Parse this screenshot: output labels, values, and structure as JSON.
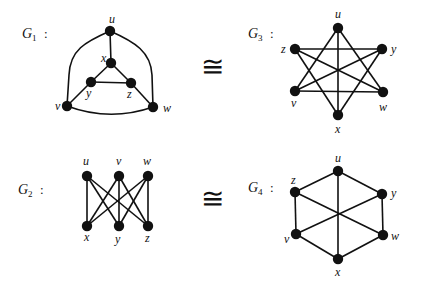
{
  "figure": {
    "isomorphism_symbol": "≅",
    "graphs": [
      {
        "id": "G1",
        "name": "G",
        "sub": "1",
        "colon": ":",
        "label_pos": [
          22,
          38
        ],
        "nodes": {
          "u": {
            "x": 110,
            "y": 31,
            "lx": 109,
            "ly": 23
          },
          "x": {
            "x": 111,
            "y": 63,
            "lx": 101,
            "ly": 62
          },
          "y": {
            "x": 91,
            "y": 82,
            "lx": 86,
            "ly": 97
          },
          "z": {
            "x": 131,
            "y": 83,
            "lx": 127,
            "ly": 98
          },
          "v": {
            "x": 67,
            "y": 106,
            "lx": 55,
            "ly": 110
          },
          "w": {
            "x": 153,
            "y": 107,
            "lx": 163,
            "ly": 112
          }
        },
        "edges": [
          [
            "u",
            "x"
          ],
          [
            "x",
            "y"
          ],
          [
            "x",
            "z"
          ],
          [
            "y",
            "z"
          ],
          [
            "y",
            "v"
          ],
          [
            "z",
            "w"
          ]
        ],
        "curved_edges": [
          {
            "from": "u",
            "to": "v",
            "path": "M110,31 C85,42 70,50 69,75 L67,106"
          },
          {
            "from": "u",
            "to": "w",
            "path": "M110,31 C135,42 151,52 152,75 L153,107"
          },
          {
            "from": "v",
            "to": "w",
            "path": "M67,106 Q110,122 153,107"
          }
        ]
      },
      {
        "id": "G3",
        "name": "G",
        "sub": "3",
        "colon": ":",
        "label_pos": [
          248,
          38
        ],
        "nodes": {
          "u": {
            "x": 338,
            "y": 28,
            "lx": 335,
            "ly": 18
          },
          "z": {
            "x": 295,
            "y": 49,
            "lx": 281,
            "ly": 53
          },
          "y": {
            "x": 382,
            "y": 49,
            "lx": 391,
            "ly": 53
          },
          "v": {
            "x": 295,
            "y": 91,
            "lx": 291,
            "ly": 107
          },
          "w": {
            "x": 383,
            "y": 92,
            "lx": 379,
            "ly": 111
          },
          "x": {
            "x": 338,
            "y": 115,
            "lx": 335,
            "ly": 133
          }
        },
        "edges": [
          [
            "u",
            "v"
          ],
          [
            "u",
            "w"
          ],
          [
            "v",
            "w"
          ],
          [
            "z",
            "y"
          ],
          [
            "y",
            "x"
          ],
          [
            "x",
            "z"
          ],
          [
            "u",
            "x"
          ],
          [
            "z",
            "w"
          ],
          [
            "y",
            "v"
          ]
        ],
        "curved_edges": []
      },
      {
        "id": "G2",
        "name": "G",
        "sub": "2",
        "colon": ":",
        "label_pos": [
          18,
          194
        ],
        "nodes": {
          "u": {
            "x": 87,
            "y": 176,
            "lx": 83,
            "ly": 165
          },
          "v": {
            "x": 119,
            "y": 176,
            "lx": 116,
            "ly": 165
          },
          "w": {
            "x": 148,
            "y": 176,
            "lx": 143,
            "ly": 165
          },
          "x": {
            "x": 87,
            "y": 226,
            "lx": 84,
            "ly": 241
          },
          "y": {
            "x": 119,
            "y": 226,
            "lx": 115,
            "ly": 243
          },
          "z": {
            "x": 148,
            "y": 226,
            "lx": 145,
            "ly": 242
          }
        },
        "edges": [
          [
            "u",
            "x"
          ],
          [
            "u",
            "y"
          ],
          [
            "u",
            "z"
          ],
          [
            "v",
            "x"
          ],
          [
            "v",
            "y"
          ],
          [
            "v",
            "z"
          ],
          [
            "w",
            "x"
          ],
          [
            "w",
            "y"
          ],
          [
            "w",
            "z"
          ]
        ],
        "curved_edges": []
      },
      {
        "id": "G4",
        "name": "G",
        "sub": "4",
        "colon": ":",
        "label_pos": [
          248,
          192
        ],
        "nodes": {
          "u": {
            "x": 338,
            "y": 171,
            "lx": 335,
            "ly": 162
          },
          "z": {
            "x": 295,
            "y": 192,
            "lx": 291,
            "ly": 184
          },
          "y": {
            "x": 382,
            "y": 194,
            "lx": 391,
            "ly": 197
          },
          "v": {
            "x": 296,
            "y": 234,
            "lx": 284,
            "ly": 243
          },
          "w": {
            "x": 383,
            "y": 235,
            "lx": 391,
            "ly": 240
          },
          "x": {
            "x": 338,
            "y": 259,
            "lx": 335,
            "ly": 276
          }
        },
        "edges": [
          [
            "u",
            "y"
          ],
          [
            "y",
            "w"
          ],
          [
            "w",
            "x"
          ],
          [
            "x",
            "v"
          ],
          [
            "v",
            "z"
          ],
          [
            "z",
            "u"
          ],
          [
            "u",
            "x"
          ],
          [
            "z",
            "w"
          ],
          [
            "y",
            "v"
          ]
        ],
        "curved_edges": []
      }
    ],
    "iso_symbols": [
      {
        "x": 212,
        "y": 76,
        "relates": [
          "G1",
          "G3"
        ]
      },
      {
        "x": 212,
        "y": 208,
        "relates": [
          "G2",
          "G4"
        ]
      }
    ]
  }
}
